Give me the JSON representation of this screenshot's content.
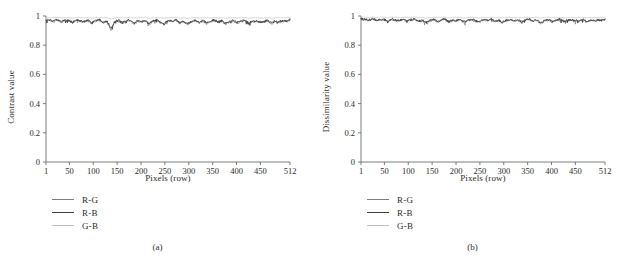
{
  "figure": {
    "panels": [
      {
        "id": "panel-a",
        "subcaption": "(a)",
        "ylabel": "Contrast value",
        "xlabel": "Pixels (row)"
      },
      {
        "id": "panel-b",
        "subcaption": "(b)",
        "ylabel": "Dissimilarity value",
        "xlabel": "Pixels (row)"
      }
    ]
  },
  "legend": {
    "entries": [
      {
        "label": "R-G",
        "color": "#7d7d7d"
      },
      {
        "label": "R-B",
        "color": "#3c3c3c"
      },
      {
        "label": "G-B",
        "color": "#c0c0c0"
      }
    ]
  },
  "axis_colors": {
    "axis": "#6e6e6e",
    "text": "#2b2b2b"
  },
  "chart_data": [
    {
      "type": "line",
      "title": "",
      "subcaption": "(a)",
      "xlabel": "Pixels (row)",
      "ylabel": "Contrast value",
      "xlim": [
        1,
        512
      ],
      "ylim": [
        0,
        1
      ],
      "xticks": [
        1,
        50,
        100,
        150,
        200,
        250,
        300,
        350,
        400,
        450,
        512
      ],
      "xticklabels": [
        "1",
        "50",
        "100",
        "150",
        "200",
        "250",
        "300",
        "350",
        "400",
        "450",
        "512"
      ],
      "yticks": [
        0,
        0.2,
        0.4,
        0.6,
        0.8,
        1
      ],
      "yticklabels": [
        "0",
        "0.2",
        "0.4",
        "0.6",
        "0.8",
        "1"
      ],
      "grid": false,
      "legend_position": "below-axes-left",
      "x": [
        1,
        9,
        17,
        25,
        33,
        41,
        49,
        57,
        65,
        73,
        81,
        89,
        97,
        105,
        113,
        121,
        129,
        137,
        145,
        153,
        161,
        169,
        177,
        185,
        193,
        201,
        209,
        217,
        225,
        233,
        241,
        249,
        257,
        265,
        273,
        281,
        289,
        297,
        305,
        313,
        321,
        329,
        337,
        345,
        353,
        361,
        369,
        377,
        385,
        393,
        401,
        409,
        417,
        425,
        433,
        441,
        449,
        457,
        465,
        473,
        481,
        489,
        497,
        505,
        512
      ],
      "series": [
        {
          "name": "R-G",
          "color": "#7d7d7d",
          "values": [
            0.972,
            0.968,
            0.962,
            0.974,
            0.958,
            0.97,
            0.966,
            0.952,
            0.971,
            0.963,
            0.957,
            0.969,
            0.948,
            0.965,
            0.972,
            0.954,
            0.961,
            0.906,
            0.958,
            0.967,
            0.95,
            0.963,
            0.971,
            0.946,
            0.964,
            0.959,
            0.968,
            0.944,
            0.962,
            0.97,
            0.955,
            0.947,
            0.966,
            0.961,
            0.972,
            0.951,
            0.963,
            0.942,
            0.958,
            0.968,
            0.954,
            0.965,
            0.949,
            0.96,
            0.971,
            0.956,
            0.964,
            0.945,
            0.959,
            0.967,
            0.953,
            0.962,
            0.97,
            0.948,
            0.961,
            0.966,
            0.952,
            0.958,
            0.969,
            0.947,
            0.963,
            0.957,
            0.966,
            0.96,
            0.971
          ]
        },
        {
          "name": "R-B",
          "color": "#3c3c3c",
          "values": [
            0.975,
            0.971,
            0.966,
            0.977,
            0.962,
            0.973,
            0.969,
            0.956,
            0.974,
            0.967,
            0.96,
            0.972,
            0.952,
            0.968,
            0.975,
            0.958,
            0.964,
            0.912,
            0.961,
            0.97,
            0.954,
            0.966,
            0.974,
            0.95,
            0.967,
            0.962,
            0.971,
            0.948,
            0.965,
            0.973,
            0.958,
            0.951,
            0.969,
            0.964,
            0.975,
            0.955,
            0.966,
            0.946,
            0.961,
            0.971,
            0.958,
            0.968,
            0.953,
            0.963,
            0.974,
            0.96,
            0.967,
            0.949,
            0.962,
            0.97,
            0.957,
            0.965,
            0.973,
            0.952,
            0.964,
            0.969,
            0.956,
            0.961,
            0.972,
            0.951,
            0.966,
            0.96,
            0.969,
            0.963,
            0.974
          ]
        },
        {
          "name": "G-B",
          "color": "#c0c0c0",
          "values": [
            0.99,
            0.989,
            0.988,
            0.991,
            0.987,
            0.99,
            0.989,
            0.986,
            0.99,
            0.988,
            0.987,
            0.989,
            0.985,
            0.988,
            0.99,
            0.986,
            0.988,
            0.98,
            0.987,
            0.989,
            0.986,
            0.988,
            0.99,
            0.985,
            0.988,
            0.987,
            0.989,
            0.984,
            0.988,
            0.99,
            0.986,
            0.985,
            0.989,
            0.988,
            0.99,
            0.986,
            0.988,
            0.984,
            0.987,
            0.989,
            0.986,
            0.988,
            0.985,
            0.987,
            0.99,
            0.986,
            0.988,
            0.984,
            0.987,
            0.989,
            0.986,
            0.988,
            0.99,
            0.985,
            0.987,
            0.989,
            0.986,
            0.987,
            0.989,
            0.985,
            0.988,
            0.987,
            0.989,
            0.988,
            0.99
          ]
        }
      ]
    },
    {
      "type": "line",
      "title": "",
      "subcaption": "(b)",
      "xlabel": "Pixels (row)",
      "ylabel": "Dissimilarity value",
      "xlim": [
        1,
        512
      ],
      "ylim": [
        0,
        1
      ],
      "xticks": [
        1,
        50,
        100,
        150,
        200,
        250,
        300,
        350,
        400,
        450,
        512
      ],
      "xticklabels": [
        "1",
        "50",
        "100",
        "150",
        "200",
        "250",
        "300",
        "350",
        "400",
        "450",
        "512"
      ],
      "yticks": [
        0,
        0.2,
        0.4,
        0.6,
        0.8,
        1
      ],
      "yticklabels": [
        "0",
        "0.2",
        "0.4",
        "0.6",
        "0.8",
        "1"
      ],
      "grid": false,
      "legend_position": "below-axes-left",
      "x": [
        1,
        9,
        17,
        25,
        33,
        41,
        49,
        57,
        65,
        73,
        81,
        89,
        97,
        105,
        113,
        121,
        129,
        137,
        145,
        153,
        161,
        169,
        177,
        185,
        193,
        201,
        209,
        217,
        225,
        233,
        241,
        249,
        257,
        265,
        273,
        281,
        289,
        297,
        305,
        313,
        321,
        329,
        337,
        345,
        353,
        361,
        369,
        377,
        385,
        393,
        401,
        409,
        417,
        425,
        433,
        441,
        449,
        457,
        465,
        473,
        481,
        489,
        497,
        505,
        512
      ],
      "series": [
        {
          "name": "R-G",
          "color": "#7d7d7d",
          "values": [
            0.978,
            0.974,
            0.97,
            0.979,
            0.968,
            0.976,
            0.972,
            0.964,
            0.977,
            0.97,
            0.966,
            0.975,
            0.96,
            0.971,
            0.977,
            0.963,
            0.968,
            0.952,
            0.966,
            0.974,
            0.96,
            0.97,
            0.976,
            0.958,
            0.971,
            0.967,
            0.974,
            0.956,
            0.969,
            0.975,
            0.964,
            0.958,
            0.972,
            0.968,
            0.977,
            0.962,
            0.97,
            0.955,
            0.966,
            0.974,
            0.963,
            0.971,
            0.959,
            0.968,
            0.976,
            0.964,
            0.97,
            0.948,
            0.966,
            0.973,
            0.962,
            0.969,
            0.975,
            0.96,
            0.968,
            0.972,
            0.963,
            0.967,
            0.974,
            0.959,
            0.97,
            0.965,
            0.972,
            0.968,
            0.976
          ]
        },
        {
          "name": "R-B",
          "color": "#3c3c3c",
          "values": [
            0.981,
            0.977,
            0.973,
            0.982,
            0.971,
            0.979,
            0.975,
            0.967,
            0.98,
            0.973,
            0.969,
            0.978,
            0.963,
            0.974,
            0.98,
            0.966,
            0.971,
            0.955,
            0.969,
            0.977,
            0.963,
            0.973,
            0.979,
            0.961,
            0.974,
            0.97,
            0.977,
            0.959,
            0.972,
            0.978,
            0.967,
            0.961,
            0.975,
            0.971,
            0.98,
            0.965,
            0.973,
            0.958,
            0.969,
            0.977,
            0.966,
            0.974,
            0.962,
            0.971,
            0.979,
            0.967,
            0.973,
            0.951,
            0.969,
            0.976,
            0.965,
            0.972,
            0.978,
            0.963,
            0.971,
            0.975,
            0.966,
            0.97,
            0.977,
            0.962,
            0.973,
            0.968,
            0.975,
            0.971,
            0.979
          ]
        },
        {
          "name": "G-B",
          "color": "#c0c0c0",
          "values": [
            0.992,
            0.991,
            0.99,
            0.993,
            0.989,
            0.992,
            0.991,
            0.988,
            0.992,
            0.99,
            0.989,
            0.991,
            0.987,
            0.99,
            0.992,
            0.988,
            0.99,
            0.984,
            0.989,
            0.991,
            0.988,
            0.99,
            0.992,
            0.987,
            0.99,
            0.989,
            0.991,
            0.986,
            0.99,
            0.992,
            0.988,
            0.987,
            0.991,
            0.99,
            0.992,
            0.988,
            0.99,
            0.986,
            0.989,
            0.991,
            0.988,
            0.99,
            0.987,
            0.989,
            0.992,
            0.988,
            0.99,
            0.986,
            0.989,
            0.991,
            0.988,
            0.99,
            0.992,
            0.987,
            0.989,
            0.991,
            0.988,
            0.989,
            0.991,
            0.987,
            0.99,
            0.989,
            0.991,
            0.99,
            0.992
          ]
        }
      ]
    }
  ]
}
